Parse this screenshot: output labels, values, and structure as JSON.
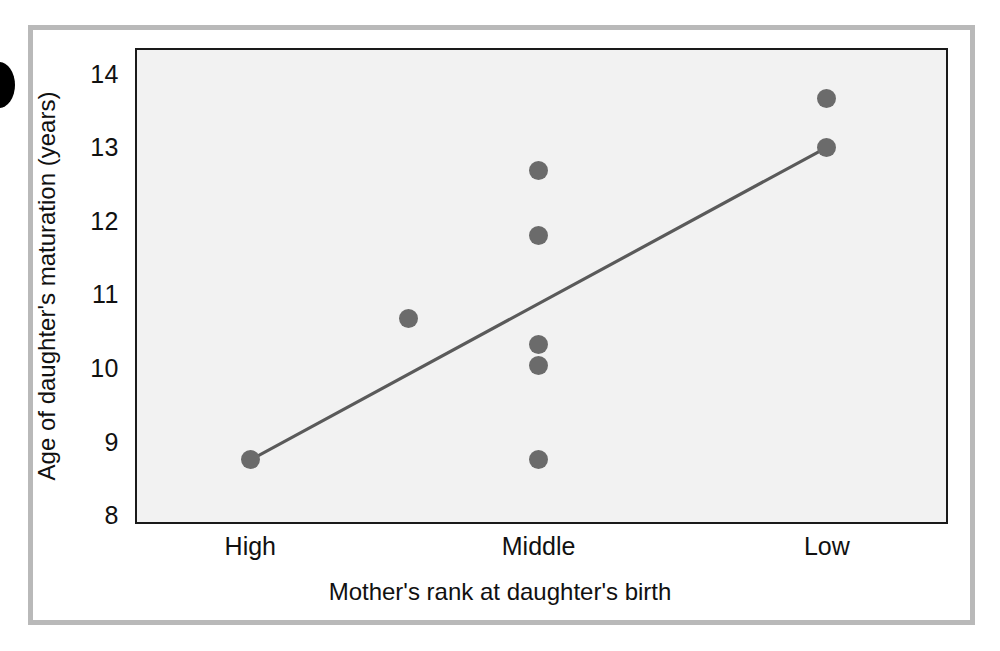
{
  "figure": {
    "bullet_marker": "figure-bullet-dot",
    "frame_color": "#b9b9b9",
    "plot_bg_color": "#f2f2f2",
    "axis_color": "#1a1a1a",
    "point_color": "#6b6b6b",
    "line_color": "#5a5a5a"
  },
  "chart_data": {
    "type": "scatter",
    "title": "",
    "xlabel": "Mother's rank at daughter's birth",
    "ylabel": "Age of daughter's maturation (years)",
    "xticklabels": [
      "High",
      "Middle",
      "Low"
    ],
    "xtick_positions": [
      1,
      2,
      3
    ],
    "yticklabels": [
      "8",
      "9",
      "10",
      "11",
      "12",
      "13",
      "14"
    ],
    "ytickvalues": [
      8,
      9,
      10,
      11,
      12,
      13,
      14
    ],
    "ylim": [
      7.88,
      14.35
    ],
    "xlim": [
      0.6,
      3.42
    ],
    "grid": false,
    "legend": null,
    "points": [
      {
        "x": 1.0,
        "y": 8.75,
        "group": "High"
      },
      {
        "x": 1.55,
        "y": 10.68,
        "group": "between High and Middle"
      },
      {
        "x": 2.0,
        "y": 12.68,
        "group": "Middle"
      },
      {
        "x": 2.0,
        "y": 11.8,
        "group": "Middle"
      },
      {
        "x": 2.0,
        "y": 10.32,
        "group": "Middle"
      },
      {
        "x": 2.0,
        "y": 10.03,
        "group": "Middle"
      },
      {
        "x": 2.0,
        "y": 8.75,
        "group": "Middle"
      },
      {
        "x": 3.0,
        "y": 13.67,
        "group": "Low"
      },
      {
        "x": 3.0,
        "y": 13.0,
        "group": "Low"
      }
    ],
    "trendline": {
      "description": "regression line",
      "x_start": 1.0,
      "y_start": 8.75,
      "x_end": 3.0,
      "y_end": 13.0
    }
  }
}
